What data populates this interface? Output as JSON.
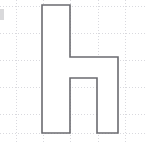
{
  "figure": {
    "width": 147,
    "height": 142,
    "background_color": "#ffffff",
    "shape": {
      "name": "letter-h-polygon",
      "stroke_color": "#6b6b70",
      "fill_color": "#ffffff",
      "stroke_width": 1.6,
      "points": "42,5 70,5 70,57 118,57 118,133 97,133 97,78 70,78 70,133 42,133",
      "vertex_count": 10,
      "closed": true
    },
    "grid": {
      "visible": true,
      "style": "dotted",
      "color": "#d9d9de",
      "spacing_x": 27.4,
      "spacing_y": 27.2,
      "vertical_lines": [
        16,
        43,
        70,
        98,
        125
      ],
      "horizontal_lines": [
        6,
        33,
        60,
        87,
        114,
        133
      ]
    },
    "edge_artifact": {
      "name": "clipped-label-fragment",
      "x": 0,
      "y": 9,
      "width": 5,
      "height": 11,
      "color": "#b9b9be"
    }
  }
}
